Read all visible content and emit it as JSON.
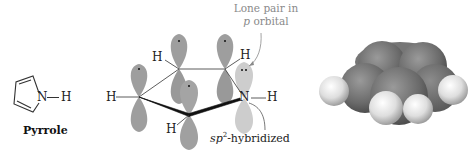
{
  "figure": {
    "structure_panel": {
      "caption": "Pyrrole",
      "ring_nh_label": "N",
      "ring_h_label": "H"
    },
    "orbital_panel": {
      "atom_labels": {
        "h_left": "H",
        "h_top_left": "H",
        "h_top_right": "H",
        "h_bottom": "H",
        "n": "N",
        "h_on_n": "H"
      },
      "annotations": {
        "lone_pair_line1": "Lone pair in",
        "lone_pair_line2_italic": "p",
        "lone_pair_line2_rest": " orbital",
        "hybrid_italic": "sp",
        "hybrid_sup": "2",
        "hybrid_rest": "-hybridized"
      }
    },
    "space_filling_panel": {
      "description": "space-filling model of pyrrole"
    },
    "colors": {
      "orbital_gray": "#9a9a9a",
      "n_orbital_light": "#c9c9c9",
      "annotation_gray": "#8a8a8a",
      "carbon_dark": "#6e6e6e",
      "hydrogen_light": "#e6e6e6"
    }
  }
}
